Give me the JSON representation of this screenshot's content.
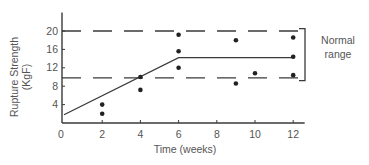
{
  "chart_data": {
    "type": "scatter",
    "title": "",
    "xlabel": "Time (weeks)",
    "ylabel": "Rupture Strength",
    "ylabel_unit": "(KgF)",
    "xlim": [
      0,
      12.6
    ],
    "ylim": [
      0,
      24
    ],
    "x_ticks": [
      0,
      2,
      4,
      6,
      8,
      10,
      12
    ],
    "y_ticks": [
      4,
      8,
      12,
      16,
      20
    ],
    "grid": false,
    "series": [
      {
        "name": "Measurements",
        "kind": "scatter",
        "points": [
          {
            "x": 2,
            "y": 4
          },
          {
            "x": 2,
            "y": 2
          },
          {
            "x": 4,
            "y": 10
          },
          {
            "x": 4,
            "y": 7.2
          },
          {
            "x": 6,
            "y": 19.2
          },
          {
            "x": 6,
            "y": 15.6
          },
          {
            "x": 6,
            "y": 12
          },
          {
            "x": 9,
            "y": 18
          },
          {
            "x": 9,
            "y": 8.6
          },
          {
            "x": 10,
            "y": 10.8
          },
          {
            "x": 12,
            "y": 18.6
          },
          {
            "x": 12,
            "y": 14.4
          },
          {
            "x": 12,
            "y": 10.4
          }
        ]
      },
      {
        "name": "Trend",
        "kind": "line",
        "points": [
          {
            "x": 0,
            "y": 1.8
          },
          {
            "x": 6,
            "y": 14.2
          },
          {
            "x": 12,
            "y": 14.2
          }
        ]
      }
    ],
    "reference_lines": [
      {
        "name": "Normal range upper",
        "y": 20,
        "style": "dashed"
      },
      {
        "name": "Normal range lower",
        "y": 9.8,
        "style": "dashed"
      }
    ],
    "annotations": [
      {
        "text_lines": [
          "Normal",
          "range"
        ],
        "type": "bracket",
        "y_from": 20.5,
        "y_to": 9.2
      }
    ]
  }
}
